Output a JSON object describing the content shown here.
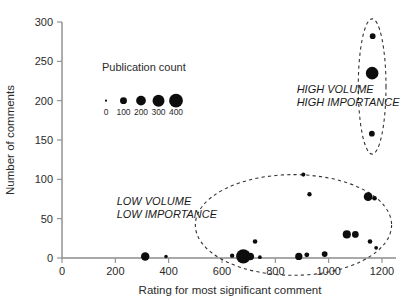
{
  "chart_data": {
    "type": "scatter",
    "title": "",
    "subtitle": "",
    "xlabel": "Rating for most significant comment",
    "ylabel": "Number of comments",
    "xlim": [
      0,
      1200
    ],
    "ylim": [
      0,
      300
    ],
    "xticks": [
      0,
      200,
      400,
      600,
      800,
      1000,
      1200
    ],
    "yticks": [
      0,
      50,
      100,
      150,
      200,
      250,
      300
    ],
    "xtick_labels": [
      "0",
      "200",
      "400",
      "600",
      "800",
      "1000",
      "1200"
    ],
    "ytick_labels": [
      "0",
      "50",
      "100",
      "150",
      "200",
      "250",
      "300"
    ],
    "grid": false,
    "legend_position": "upper-left-inside",
    "size_encoding": {
      "label": "Publication count",
      "values": [
        0,
        100,
        200,
        300,
        400
      ],
      "tick_labels": [
        "0",
        "100",
        "200",
        "300",
        "400"
      ],
      "legend_point_y": 200
    },
    "series": [
      {
        "name": "Journals",
        "color": "#0d0d0d",
        "points": [
          {
            "x": 312,
            "y": 2,
            "size": 150
          },
          {
            "x": 390,
            "y": 2,
            "size": 25
          },
          {
            "x": 638,
            "y": 3,
            "size": 40
          },
          {
            "x": 680,
            "y": 2,
            "size": 430
          },
          {
            "x": 706,
            "y": 2,
            "size": 120
          },
          {
            "x": 724,
            "y": 21,
            "size": 45
          },
          {
            "x": 742,
            "y": 1,
            "size": 30
          },
          {
            "x": 888,
            "y": 2,
            "size": 110
          },
          {
            "x": 905,
            "y": 106,
            "size": 35
          },
          {
            "x": 918,
            "y": 4,
            "size": 50
          },
          {
            "x": 928,
            "y": 81,
            "size": 40
          },
          {
            "x": 985,
            "y": 5,
            "size": 70
          },
          {
            "x": 1068,
            "y": 30,
            "size": 140
          },
          {
            "x": 1100,
            "y": 30,
            "size": 95
          },
          {
            "x": 1148,
            "y": 78,
            "size": 160
          },
          {
            "x": 1172,
            "y": 76,
            "size": 45
          },
          {
            "x": 1155,
            "y": 21,
            "size": 45
          },
          {
            "x": 1178,
            "y": 13,
            "size": 30
          },
          {
            "x": 1165,
            "y": 282,
            "size": 70
          },
          {
            "x": 1163,
            "y": 235,
            "size": 330
          },
          {
            "x": 1162,
            "y": 158,
            "size": 70
          }
        ]
      }
    ],
    "annotations": [
      {
        "id": "high-volume-cluster",
        "text_lines": [
          "HIGH VOLUME",
          "HIGH IMPORTANCE"
        ],
        "text_x": 880,
        "text_y": 210,
        "ellipse": {
          "cx": 1163,
          "cy": 218,
          "rx": 52,
          "ry": 86,
          "rotation": 0
        }
      },
      {
        "id": "low-volume-cluster",
        "text_lines": [
          "LOW VOLUME",
          "LOW IMPORTANCE"
        ],
        "text_x": 205,
        "text_y": 68,
        "ellipse": {
          "cx": 868,
          "cy": 42,
          "rx": 368,
          "ry": 64,
          "rotation": 0
        }
      }
    ]
  },
  "colors": {
    "bubble": "#0d0d0d",
    "axis": "#8c8c8c",
    "text": "#2b2b2b",
    "annotation": "#1a1a1a",
    "ellipse": "#333333",
    "background": "#ffffff"
  }
}
